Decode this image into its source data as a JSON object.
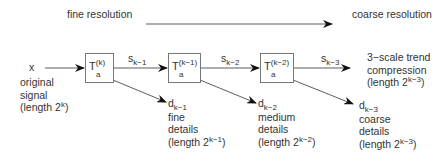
{
  "header": {
    "left_label": "fine resolution",
    "right_label": "coarse resolution"
  },
  "input": {
    "symbol": "x",
    "desc_line1": "original",
    "desc_line2": "signal",
    "length_prefix": "(length 2",
    "length_exp": "k",
    "length_suffix": ")"
  },
  "stages": [
    {
      "transform": {
        "base": "T",
        "sub": "a",
        "sup": "(k)"
      },
      "smooth": {
        "base": "s",
        "sub": "k−1"
      },
      "detail": {
        "base": "d",
        "sub": "k−1"
      },
      "detail_desc_line1": "fine",
      "detail_desc_line2": "details",
      "length_prefix": "(length 2",
      "length_exp": "k−1",
      "length_suffix": ")"
    },
    {
      "transform": {
        "base": "T",
        "sub": "a",
        "sup": "(k−1)"
      },
      "smooth": {
        "base": "s",
        "sub": "k−2"
      },
      "detail": {
        "base": "d",
        "sub": "k−2"
      },
      "detail_desc_line1": "medium",
      "detail_desc_line2": "details",
      "length_prefix": "(length 2",
      "length_exp": "k−2",
      "length_suffix": ")"
    },
    {
      "transform": {
        "base": "T",
        "sub": "a",
        "sup": "(k−2)"
      },
      "smooth": {
        "base": "s",
        "sub": "k−3"
      },
      "detail": {
        "base": "d",
        "sub": "k−3"
      },
      "detail_desc_line1": "coarse",
      "detail_desc_line2": "details",
      "length_prefix": "(length 2",
      "length_exp": "k−3",
      "length_suffix": ")"
    }
  ],
  "output": {
    "line1": "3−scale trend",
    "line2": "compression",
    "length_prefix": "(length 2",
    "length_exp": "k−3",
    "length_suffix": ")"
  }
}
